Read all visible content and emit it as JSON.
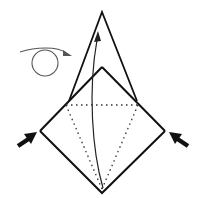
{
  "diagram": {
    "type": "origami-step",
    "description": "Origami folding step: turn over, then collapse the sides inward while lifting the bottom point up",
    "colors": {
      "line": "#111111",
      "arrow_thin": "#333333",
      "loop": "#555555",
      "push_arrow": "#111111",
      "background": "#ffffff"
    },
    "symbols": [
      {
        "name": "turn-over-arrow",
        "meaning": "turn model over"
      },
      {
        "name": "lift-arrow",
        "meaning": "fold bottom point up"
      },
      {
        "name": "push-arrow-left",
        "meaning": "push in from left"
      },
      {
        "name": "push-arrow-right",
        "meaning": "push in from right"
      },
      {
        "name": "valley-fold-lines",
        "meaning": "dotted fold lines"
      }
    ]
  }
}
